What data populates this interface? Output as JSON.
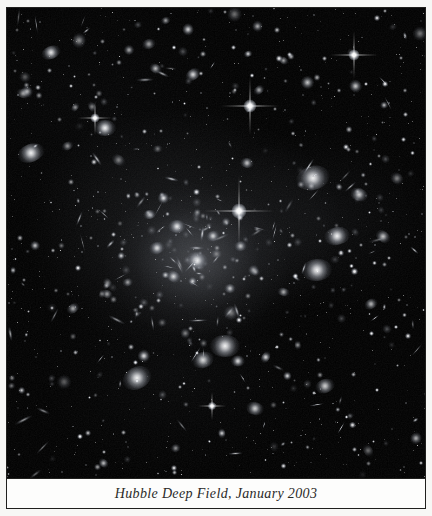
{
  "plate": {
    "caption": "Hubble Deep Field, January 2003",
    "photo_background": "#000000",
    "frame_color": "#20201e",
    "page_background": "#f7f7f5",
    "caption_background": "#fdfdfc",
    "caption_text_color": "#2a2a28"
  },
  "photo": {
    "subject": "deep-field-galaxy-cluster",
    "cluster_glow": {
      "cx": 190,
      "cy": 252,
      "rx": 95,
      "ry": 78
    },
    "bright_stars": [
      {
        "name": "diffraction-star-center",
        "x": 232,
        "y": 203,
        "size": 15,
        "spike": 70
      },
      {
        "name": "diffraction-star-upper",
        "x": 243,
        "y": 98,
        "size": 13,
        "spike": 58
      },
      {
        "name": "diffraction-star-upper-right",
        "x": 347,
        "y": 47,
        "size": 11,
        "spike": 48
      },
      {
        "name": "diffraction-star-left",
        "x": 88,
        "y": 110,
        "size": 9,
        "spike": 34
      },
      {
        "name": "diffraction-star-lower",
        "x": 205,
        "y": 398,
        "size": 8,
        "spike": 28
      }
    ],
    "galaxies": [
      {
        "x": 44,
        "y": 44,
        "w": 20,
        "h": 13,
        "r": -22,
        "b": 0.95
      },
      {
        "x": 24,
        "y": 145,
        "w": 28,
        "h": 18,
        "r": -20,
        "b": 1.0
      },
      {
        "x": 60,
        "y": 138,
        "w": 13,
        "h": 8,
        "r": -25,
        "b": 0.6
      },
      {
        "x": 122,
        "y": 42,
        "w": 10,
        "h": 10,
        "r": 0,
        "b": 0.7
      },
      {
        "x": 148,
        "y": 60,
        "w": 13,
        "h": 9,
        "r": 30,
        "b": 0.75
      },
      {
        "x": 186,
        "y": 66,
        "w": 16,
        "h": 11,
        "r": -35,
        "b": 0.9
      },
      {
        "x": 98,
        "y": 120,
        "w": 22,
        "h": 16,
        "r": 0,
        "b": 1.0
      },
      {
        "x": 240,
        "y": 155,
        "w": 14,
        "h": 10,
        "r": 10,
        "b": 0.8
      },
      {
        "x": 252,
        "y": 82,
        "w": 12,
        "h": 8,
        "r": -40,
        "b": 0.7
      },
      {
        "x": 276,
        "y": 52,
        "w": 11,
        "h": 7,
        "r": 25,
        "b": 0.65
      },
      {
        "x": 300,
        "y": 74,
        "w": 13,
        "h": 13,
        "r": 0,
        "b": 0.8
      },
      {
        "x": 306,
        "y": 170,
        "w": 34,
        "h": 24,
        "r": -15,
        "b": 1.0
      },
      {
        "x": 352,
        "y": 186,
        "w": 18,
        "h": 13,
        "r": 20,
        "b": 0.85
      },
      {
        "x": 330,
        "y": 228,
        "w": 26,
        "h": 18,
        "r": -10,
        "b": 1.0
      },
      {
        "x": 376,
        "y": 228,
        "w": 16,
        "h": 11,
        "r": 35,
        "b": 0.8
      },
      {
        "x": 310,
        "y": 262,
        "w": 30,
        "h": 22,
        "r": -5,
        "b": 1.0
      },
      {
        "x": 364,
        "y": 296,
        "w": 14,
        "h": 10,
        "r": -30,
        "b": 0.75
      },
      {
        "x": 218,
        "y": 338,
        "w": 30,
        "h": 22,
        "r": 0,
        "b": 1.0
      },
      {
        "x": 196,
        "y": 352,
        "w": 22,
        "h": 16,
        "r": -15,
        "b": 0.9
      },
      {
        "x": 130,
        "y": 370,
        "w": 30,
        "h": 22,
        "r": -28,
        "b": 1.0
      },
      {
        "x": 248,
        "y": 400,
        "w": 18,
        "h": 13,
        "r": 12,
        "b": 0.85
      },
      {
        "x": 318,
        "y": 378,
        "w": 20,
        "h": 14,
        "r": -18,
        "b": 0.85
      },
      {
        "x": 66,
        "y": 300,
        "w": 14,
        "h": 9,
        "r": -35,
        "b": 0.7
      },
      {
        "x": 100,
        "y": 286,
        "w": 12,
        "h": 8,
        "r": 20,
        "b": 0.65
      },
      {
        "x": 170,
        "y": 218,
        "w": 18,
        "h": 13,
        "r": 0,
        "b": 0.95
      },
      {
        "x": 150,
        "y": 240,
        "w": 16,
        "h": 12,
        "r": -18,
        "b": 0.9
      },
      {
        "x": 190,
        "y": 252,
        "w": 22,
        "h": 17,
        "r": 8,
        "b": 1.0
      },
      {
        "x": 206,
        "y": 228,
        "w": 14,
        "h": 10,
        "r": -22,
        "b": 0.85
      },
      {
        "x": 166,
        "y": 268,
        "w": 15,
        "h": 11,
        "r": 30,
        "b": 0.85
      },
      {
        "x": 142,
        "y": 206,
        "w": 13,
        "h": 9,
        "r": -10,
        "b": 0.8
      }
    ]
  }
}
